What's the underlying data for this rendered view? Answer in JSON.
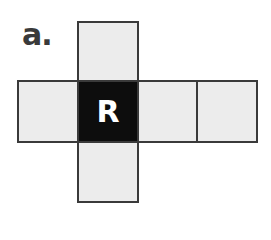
{
  "figure": {
    "label": "a.",
    "colors": {
      "face_fill": "#ececec",
      "marked_face_fill": "#0d0d0d",
      "border": "#3a3a3a",
      "letter": "#ffffff"
    },
    "faces": [
      {
        "id": "top",
        "marked": false,
        "letter": ""
      },
      {
        "id": "left",
        "marked": false,
        "letter": ""
      },
      {
        "id": "center",
        "marked": true,
        "letter": "R"
      },
      {
        "id": "right-1",
        "marked": false,
        "letter": ""
      },
      {
        "id": "right-2",
        "marked": false,
        "letter": ""
      },
      {
        "id": "bottom",
        "marked": false,
        "letter": ""
      }
    ]
  }
}
